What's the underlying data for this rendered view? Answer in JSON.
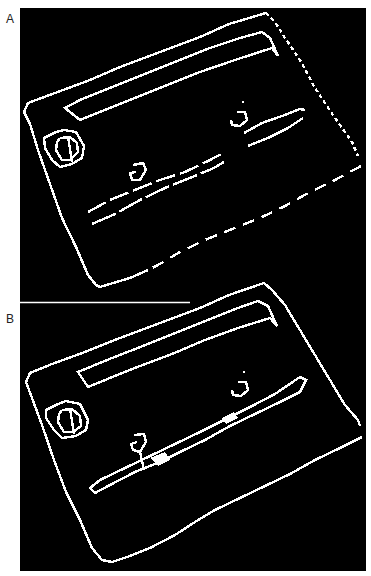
{
  "figure": {
    "background": "#ffffff",
    "field_color": "#000000",
    "edge_color": "#ffffff",
    "panels": [
      {
        "label": "A",
        "description": "Edge-detected outline of tilted card; broken (dashed) lower-right edge and dashed secondary lines"
      },
      {
        "label": "B",
        "description": "Edge-detected outline of tilted card; continuous edges, merged parallel lines"
      }
    ]
  }
}
